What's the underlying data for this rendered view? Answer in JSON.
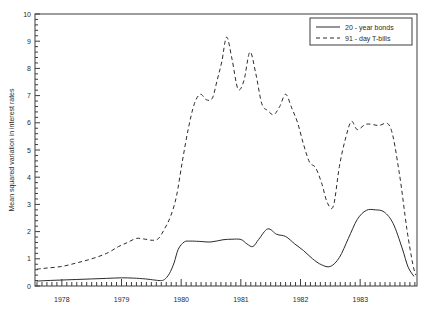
{
  "chart_data": {
    "type": "line",
    "title": "",
    "xlabel": "",
    "ylabel": "Mean squared variation in interest rates",
    "xlim": [
      1977.55,
      1983.95
    ],
    "ylim": [
      0,
      10
    ],
    "yticks": [
      0,
      1,
      2,
      3,
      4,
      5,
      6,
      7,
      8,
      9,
      10
    ],
    "ytick_labels": [
      "0",
      "1",
      "2",
      "3",
      "4",
      "5",
      "6",
      "7",
      "8",
      "9",
      "10"
    ],
    "xticks": [
      1978,
      1979,
      1980,
      1981,
      1982,
      1983
    ],
    "xtick_labels": [
      "1978",
      "1979",
      "1980",
      "1981",
      "1982",
      "1983"
    ],
    "minor_xtick_interval": 0.0833,
    "grid": false,
    "legend_position": "top-right",
    "series": [
      {
        "name": "20 - year bonds",
        "style": "solid",
        "color": "#2b2b2b",
        "x": [
          1977.58,
          1977.75,
          1978.0,
          1978.25,
          1978.5,
          1978.75,
          1979.0,
          1979.2,
          1979.4,
          1979.55,
          1979.65,
          1979.72,
          1979.8,
          1979.88,
          1979.95,
          1980.05,
          1980.15,
          1980.3,
          1980.5,
          1980.7,
          1980.85,
          1981.0,
          1981.1,
          1981.2,
          1981.3,
          1981.45,
          1981.6,
          1981.75,
          1981.9,
          1982.05,
          1982.2,
          1982.35,
          1982.5,
          1982.65,
          1982.8,
          1982.95,
          1983.1,
          1983.25,
          1983.4,
          1983.55,
          1983.7,
          1983.8,
          1983.9
        ],
        "y": [
          0.18,
          0.2,
          0.22,
          0.24,
          0.26,
          0.28,
          0.3,
          0.29,
          0.26,
          0.22,
          0.2,
          0.24,
          0.45,
          0.85,
          1.35,
          1.62,
          1.65,
          1.64,
          1.62,
          1.7,
          1.72,
          1.71,
          1.55,
          1.45,
          1.72,
          2.1,
          1.9,
          1.82,
          1.55,
          1.3,
          1.0,
          0.78,
          0.72,
          1.05,
          1.75,
          2.45,
          2.78,
          2.8,
          2.72,
          2.3,
          1.4,
          0.7,
          0.35
        ]
      },
      {
        "name": "91 - day T-bills",
        "style": "dashed",
        "color": "#2b2b2b",
        "x": [
          1977.58,
          1977.75,
          1978.0,
          1978.25,
          1978.5,
          1978.75,
          1978.95,
          1979.1,
          1979.25,
          1979.4,
          1979.52,
          1979.62,
          1979.72,
          1979.82,
          1979.92,
          1980.02,
          1980.12,
          1980.22,
          1980.32,
          1980.42,
          1980.52,
          1980.6,
          1980.68,
          1980.76,
          1980.85,
          1980.95,
          1981.05,
          1981.15,
          1981.25,
          1981.35,
          1981.45,
          1981.55,
          1981.65,
          1981.75,
          1981.85,
          1981.95,
          1982.05,
          1982.15,
          1982.25,
          1982.35,
          1982.45,
          1982.55,
          1982.65,
          1982.75,
          1982.85,
          1982.95,
          1983.1,
          1983.3,
          1983.5,
          1983.65,
          1983.78,
          1983.88,
          1983.93
        ],
        "y": [
          0.62,
          0.66,
          0.72,
          0.85,
          1.0,
          1.2,
          1.45,
          1.6,
          1.75,
          1.72,
          1.68,
          1.75,
          2.1,
          2.55,
          3.3,
          4.6,
          5.8,
          6.7,
          7.05,
          6.85,
          6.9,
          7.55,
          8.25,
          9.15,
          8.35,
          7.25,
          7.55,
          8.6,
          7.8,
          6.7,
          6.45,
          6.3,
          6.6,
          7.05,
          6.55,
          6.0,
          5.2,
          4.55,
          4.35,
          3.8,
          3.05,
          2.95,
          4.4,
          5.4,
          6.05,
          5.75,
          5.95,
          5.9,
          5.85,
          4.2,
          2.1,
          0.8,
          0.4
        ]
      }
    ],
    "legend": [
      {
        "label": "20 - year bonds",
        "style": "solid"
      },
      {
        "label": "91 - day T-bills",
        "style": "dashed"
      }
    ]
  }
}
